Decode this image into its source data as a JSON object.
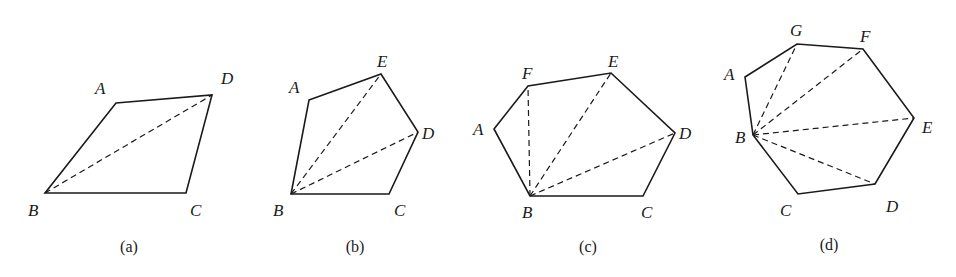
{
  "figures": [
    {
      "caption": "(a)",
      "caption_pos": [
        129,
        252
      ],
      "polygon": [
        [
          116,
          103
        ],
        [
          212,
          95
        ],
        [
          186,
          193
        ],
        [
          45,
          193
        ]
      ],
      "diagonals": [
        [
          [
            45,
            193
          ],
          [
            212,
            95
          ]
        ]
      ],
      "labels": [
        {
          "text": "A",
          "x": 95,
          "y": 94
        },
        {
          "text": "D",
          "x": 221,
          "y": 84
        },
        {
          "text": "B",
          "x": 28,
          "y": 216
        },
        {
          "text": "C",
          "x": 190,
          "y": 216
        }
      ]
    },
    {
      "caption": "(b)",
      "caption_pos": [
        355,
        252
      ],
      "polygon": [
        [
          309,
          100
        ],
        [
          381,
          74
        ],
        [
          418,
          132
        ],
        [
          389,
          194
        ],
        [
          291,
          194
        ]
      ],
      "diagonals": [
        [
          [
            291,
            194
          ],
          [
            381,
            74
          ]
        ],
        [
          [
            291,
            194
          ],
          [
            418,
            132
          ]
        ]
      ],
      "labels": [
        {
          "text": "A",
          "x": 289,
          "y": 93
        },
        {
          "text": "E",
          "x": 377,
          "y": 67
        },
        {
          "text": "D",
          "x": 422,
          "y": 139
        },
        {
          "text": "B",
          "x": 273,
          "y": 216
        },
        {
          "text": "C",
          "x": 394,
          "y": 216
        }
      ]
    },
    {
      "caption": "(c)",
      "caption_pos": [
        588,
        252
      ],
      "polygon": [
        [
          494,
          129
        ],
        [
          528,
          86
        ],
        [
          611,
          73
        ],
        [
          675,
          133
        ],
        [
          643,
          196
        ],
        [
          530,
          196
        ]
      ],
      "diagonals": [
        [
          [
            530,
            196
          ],
          [
            528,
            86
          ]
        ],
        [
          [
            530,
            196
          ],
          [
            611,
            73
          ]
        ],
        [
          [
            530,
            196
          ],
          [
            675,
            133
          ]
        ]
      ],
      "labels": [
        {
          "text": "A",
          "x": 473,
          "y": 135
        },
        {
          "text": "F",
          "x": 522,
          "y": 79
        },
        {
          "text": "E",
          "x": 608,
          "y": 67
        },
        {
          "text": "D",
          "x": 679,
          "y": 139
        },
        {
          "text": "B",
          "x": 522,
          "y": 218
        },
        {
          "text": "C",
          "x": 641,
          "y": 218
        }
      ]
    },
    {
      "caption": "(d)",
      "caption_pos": [
        829,
        250
      ],
      "polygon": [
        [
          745,
          77
        ],
        [
          797,
          44
        ],
        [
          863,
          49
        ],
        [
          914,
          118
        ],
        [
          875,
          184
        ],
        [
          798,
          194
        ],
        [
          753,
          135
        ]
      ],
      "diagonals": [
        [
          [
            753,
            135
          ],
          [
            797,
            44
          ]
        ],
        [
          [
            753,
            135
          ],
          [
            863,
            49
          ]
        ],
        [
          [
            753,
            135
          ],
          [
            914,
            118
          ]
        ],
        [
          [
            753,
            135
          ],
          [
            875,
            184
          ]
        ]
      ],
      "labels": [
        {
          "text": "A",
          "x": 724,
          "y": 80
        },
        {
          "text": "G",
          "x": 790,
          "y": 36
        },
        {
          "text": "F",
          "x": 860,
          "y": 42
        },
        {
          "text": "E",
          "x": 922,
          "y": 133
        },
        {
          "text": "B",
          "x": 735,
          "y": 143
        },
        {
          "text": "D",
          "x": 886,
          "y": 212
        },
        {
          "text": "C",
          "x": 780,
          "y": 216
        }
      ]
    }
  ]
}
